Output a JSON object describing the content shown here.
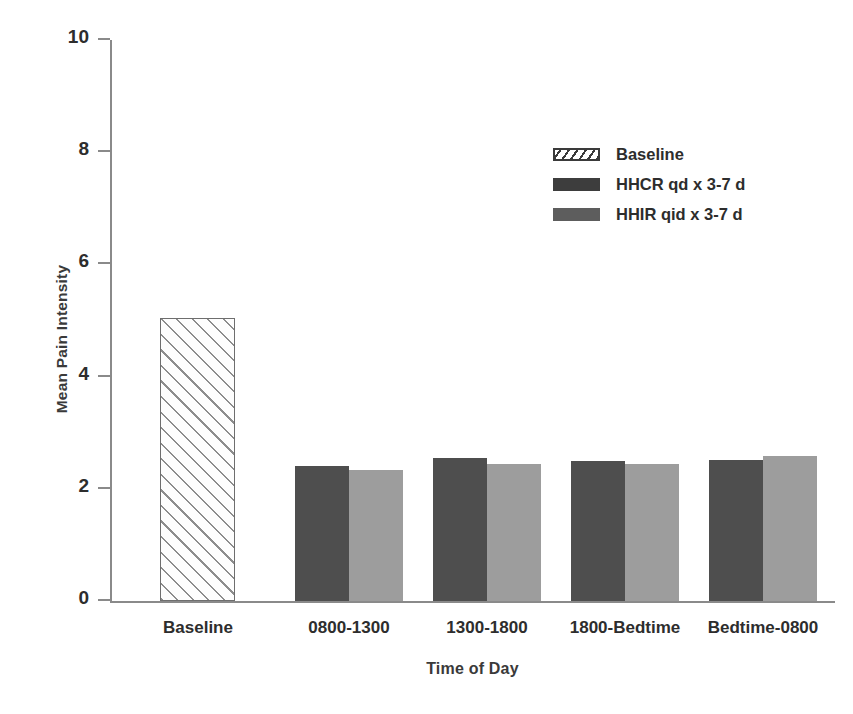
{
  "chart_data": {
    "type": "bar",
    "title": "",
    "xlabel": "Time of Day",
    "ylabel": "Mean Pain Intensity",
    "ylim": [
      0,
      10
    ],
    "ytick_values": [
      0,
      2,
      4,
      6,
      8,
      10
    ],
    "ytick_labels": [
      "0",
      "2",
      "4",
      "6",
      "8",
      "10"
    ],
    "grid": false,
    "legend_position": "upper right",
    "categories": [
      "Baseline",
      "0800-1300",
      "1300-1800",
      "1800-Bedtime",
      "Bedtime-0800"
    ],
    "series": [
      {
        "name": "Baseline",
        "fill": "hatch",
        "values": [
          5.05,
          null,
          null,
          null,
          null
        ]
      },
      {
        "name": "HHCR qd x 3-7 d",
        "fill": "dark",
        "color": "#4e4e4e",
        "values": [
          null,
          2.4,
          2.55,
          2.5,
          2.52
        ]
      },
      {
        "name": "HHIR qid x 3-7 d",
        "fill": "light",
        "color": "#9d9d9d",
        "values": [
          null,
          2.33,
          2.45,
          2.45,
          2.58
        ]
      }
    ],
    "legend": [
      {
        "label": "Baseline",
        "fill": "hatch"
      },
      {
        "label": "HHCR qd x 3-7 d",
        "fill": "dark"
      },
      {
        "label": "HHIR qid x 3-7 d",
        "fill": "light"
      }
    ],
    "bars": [
      {
        "group": "Baseline",
        "series": "Baseline",
        "value": 5.05,
        "fill": "hatch",
        "x": 50,
        "width": 75
      },
      {
        "group": "0800-1300",
        "series": "HHCR qd x 3-7 d",
        "value": 2.4,
        "fill": "dark",
        "x": 185,
        "width": 54
      },
      {
        "group": "0800-1300",
        "series": "HHIR qid x 3-7 d",
        "value": 2.33,
        "fill": "light",
        "x": 239,
        "width": 54
      },
      {
        "group": "1300-1800",
        "series": "HHCR qd x 3-7 d",
        "value": 2.55,
        "fill": "dark",
        "x": 323,
        "width": 54
      },
      {
        "group": "1300-1800",
        "series": "HHIR qid x 3-7 d",
        "value": 2.45,
        "fill": "light",
        "x": 377,
        "width": 54
      },
      {
        "group": "1800-Bedtime",
        "series": "HHCR qd x 3-7 d",
        "value": 2.5,
        "fill": "dark",
        "x": 461,
        "width": 54
      },
      {
        "group": "1800-Bedtime",
        "series": "HHIR qid x 3-7 d",
        "value": 2.45,
        "fill": "light",
        "x": 515,
        "width": 54
      },
      {
        "group": "Bedtime-0800",
        "series": "HHCR qd x 3-7 d",
        "value": 2.52,
        "fill": "dark",
        "x": 599,
        "width": 54
      },
      {
        "group": "Bedtime-0800",
        "series": "HHIR qid x 3-7 d",
        "value": 2.58,
        "fill": "light",
        "x": 653,
        "width": 54
      }
    ],
    "group_centers": [
      88,
      239,
      377,
      515,
      653
    ]
  }
}
